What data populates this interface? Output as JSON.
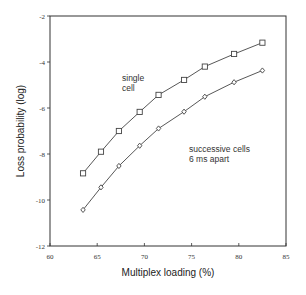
{
  "chart_data": {
    "type": "line",
    "title": "",
    "xlabel": "Multiplex loading (%)",
    "ylabel": "Loss probability (log)",
    "xlim": [
      60,
      85
    ],
    "ylim": [
      -12,
      -2
    ],
    "xticks": [
      60,
      65,
      70,
      75,
      80,
      85
    ],
    "yticks": [
      -2,
      -4,
      -6,
      -8,
      -10,
      -12
    ],
    "grid": false,
    "legend": "inline annotations",
    "x": [
      63.5,
      65.4,
      67.3,
      69.5,
      71.5,
      74.2,
      76.4,
      79.5,
      82.5
    ],
    "series": [
      {
        "name": "single cell",
        "marker": "square",
        "values": [
          -8.84,
          -7.9,
          -7.0,
          -6.17,
          -5.43,
          -4.78,
          -4.2,
          -3.65,
          -3.16
        ]
      },
      {
        "name": "successive cells 6 ms apart",
        "marker": "diamond",
        "values": [
          -10.43,
          -9.45,
          -8.52,
          -7.64,
          -6.89,
          -6.16,
          -5.51,
          -4.88,
          -4.37
        ]
      }
    ],
    "annotations": [
      {
        "text": [
          "single",
          "cell"
        ],
        "near_series": "single cell"
      },
      {
        "text": [
          "successive cells",
          "6 ms apart"
        ],
        "near_series": "successive cells 6 ms apart"
      }
    ]
  },
  "colors": {
    "axis": "#333333",
    "line": "#444444",
    "marker_fill": "#ffffff"
  }
}
